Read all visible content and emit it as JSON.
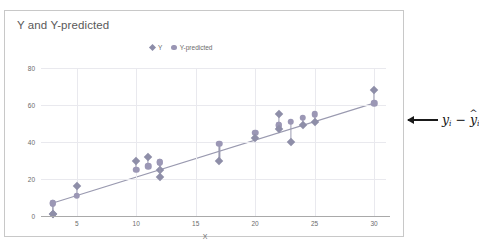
{
  "chart_data": {
    "type": "scatter",
    "title": "Y and Y-predicted",
    "xlabel": "X",
    "ylabel": "",
    "xlim": [
      2,
      31
    ],
    "ylim": [
      0,
      80
    ],
    "xticks": [
      "5",
      "10",
      "15",
      "20",
      "25",
      "30"
    ],
    "yticks": [
      "0",
      "20",
      "40",
      "60",
      "80"
    ],
    "grid": true,
    "legend_position": "top-center",
    "legend": [
      "Y",
      "Y-predicted"
    ],
    "x": [
      3,
      3,
      5,
      10,
      11,
      12,
      12,
      17,
      20,
      22,
      22,
      23,
      24,
      25,
      30
    ],
    "series": [
      {
        "name": "Y",
        "marker": "diamond",
        "color": "#8e8ea8",
        "values": [
          1,
          1,
          16,
          30,
          32,
          25,
          21,
          30,
          42,
          55,
          47,
          40,
          49,
          51,
          68
        ]
      },
      {
        "name": "Y-predicted",
        "marker": "circle",
        "color": "#9b97b5",
        "values": [
          7,
          7,
          11,
          25,
          27,
          29,
          29,
          39,
          45,
          49,
          49,
          51,
          53,
          55,
          61
        ]
      }
    ],
    "regression_line": {
      "x": [
        3,
        30
      ],
      "y": [
        7,
        61
      ],
      "color": "#9a9ab0"
    },
    "residual_lines": true,
    "annotation": {
      "text": "y_i - yhat_i",
      "y_symbol": "y",
      "sub": "i",
      "minus": "−",
      "hat": "̂",
      "arrow": "left-arrow"
    }
  },
  "legend": {
    "items": [
      {
        "label": "Y",
        "marker": "diamond-marker-icon"
      },
      {
        "label": "Y-predicted",
        "marker": "circle-marker-icon"
      }
    ]
  }
}
